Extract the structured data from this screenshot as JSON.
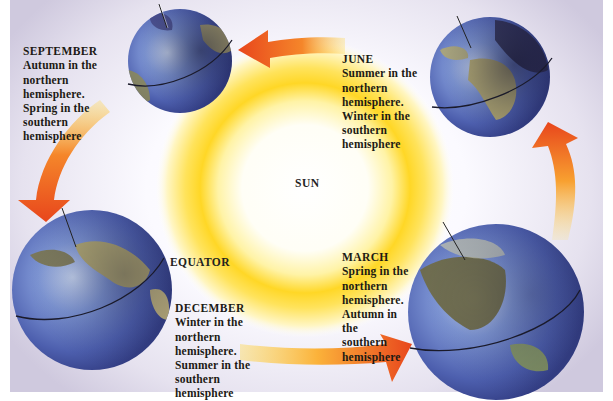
{
  "diagram": {
    "type": "earth-orbit-seasons",
    "center": {
      "label": "SUN"
    },
    "equator_label": "EQUATOR",
    "colors": {
      "sun_core": "#ffffff",
      "sun_glow": "#ffd21a",
      "arrow_head": "#e8461c",
      "arrow_tail": "#ffd84a",
      "ocean": "#5d76c4",
      "land": "#b7ab6a",
      "background": "#e6e2ef"
    },
    "seasons": [
      {
        "month": "SEPTEMBER",
        "lines": "Autumn in the\nnorthern\nhemisphere.\nSpring in the\nsouthern\nhemisphere"
      },
      {
        "month": "JUNE",
        "lines": "Summer in the\nnorthern\nhemisphere.\nWinter in the\nsouthern\nhemisphere"
      },
      {
        "month": "DECEMBER",
        "lines": "Winter in the\nnorthern\nhemisphere.\nSummer in the\nsouthern\nhemisphere"
      },
      {
        "month": "MARCH",
        "lines": "Spring in the\nnorthern\nhemisphere.\nAutumn in\nthe\nsouthern\nhemisphere"
      }
    ],
    "orbit_arrows": [
      {
        "from": "MARCH",
        "to": "JUNE",
        "direction": "up"
      },
      {
        "from": "JUNE",
        "to": "SEPTEMBER",
        "direction": "left"
      },
      {
        "from": "SEPTEMBER",
        "to": "DECEMBER",
        "direction": "down"
      },
      {
        "from": "DECEMBER",
        "to": "MARCH",
        "direction": "right"
      }
    ]
  }
}
